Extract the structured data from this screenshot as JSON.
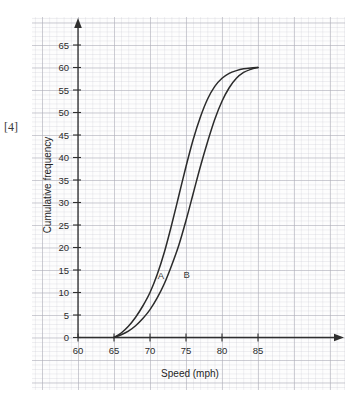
{
  "page": {
    "marks_label": "[4]",
    "background_color": "#ffffff"
  },
  "chart_data": {
    "type": "line",
    "title": "",
    "subtitle": "",
    "xlabel": "Speed (mph)",
    "ylabel": "Cumulative frequency",
    "xlim": [
      60,
      87.5
    ],
    "ylim": [
      0,
      67
    ],
    "xticks": [
      60,
      65,
      70,
      75,
      80,
      85
    ],
    "yticks": [
      0,
      5,
      10,
      15,
      20,
      25,
      30,
      35,
      40,
      45,
      50,
      55,
      60,
      65
    ],
    "xtick_labels": [
      "60",
      "65",
      "70",
      "75",
      "80",
      "85"
    ],
    "ytick_labels": [
      "0",
      "5",
      "10",
      "15",
      "20",
      "25",
      "30",
      "35",
      "40",
      "45",
      "50",
      "55",
      "60",
      "65"
    ],
    "grid": true,
    "grid_style": "graph-paper",
    "grid_major_color": "#b0b0ba",
    "grid_minor_color": "#c8c8d2",
    "legend": "inline-annotations",
    "legend_position": "on-curve",
    "line_color": "#2b2b2b",
    "axis_arrows": true,
    "annotations": [
      {
        "text": "A",
        "x": 71.5,
        "y": 13.0
      },
      {
        "text": "B",
        "x": 75.1,
        "y": 13.2
      }
    ],
    "series": [
      {
        "name": "A",
        "label": "A",
        "x": [
          65,
          66,
          67,
          68,
          69,
          70,
          71,
          72,
          73,
          74,
          75,
          76,
          77,
          78,
          79,
          80,
          81,
          82,
          83,
          84,
          85
        ],
        "values": [
          0,
          1,
          2.5,
          4.5,
          7,
          10,
          14,
          19,
          25,
          31.5,
          38,
          44,
          49,
          53,
          55.8,
          57.6,
          58.7,
          59.3,
          59.7,
          59.9,
          60
        ]
      },
      {
        "name": "B",
        "label": "B",
        "x": [
          65,
          66,
          67,
          68,
          69,
          70,
          71,
          72,
          73,
          74,
          75,
          76,
          77,
          78,
          79,
          80,
          81,
          82,
          83,
          84,
          85
        ],
        "values": [
          0,
          0.6,
          1.4,
          2.6,
          4.2,
          6.2,
          8.8,
          12,
          16,
          20.5,
          26,
          32,
          38,
          43.5,
          48.5,
          52.5,
          55.5,
          57.6,
          58.9,
          59.6,
          60
        ]
      }
    ]
  }
}
